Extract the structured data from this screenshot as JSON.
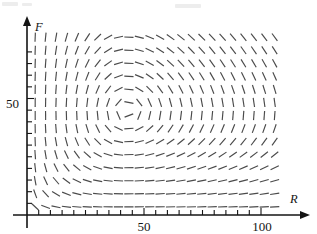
{
  "figure": {
    "kind": "direction-field",
    "background_color": "#ffffff",
    "mark_color": "#4a4a4a",
    "axis_color": "#141414"
  },
  "axes": {
    "x": {
      "label": "R",
      "label_style": "italic-serif",
      "tick_labels": [
        "50",
        "100"
      ],
      "tick_label_values": [
        50,
        100
      ],
      "minor_ticks_count": 20,
      "range": [
        0,
        108
      ],
      "arrow": true
    },
    "y": {
      "label": "F",
      "label_style": "italic-serif",
      "tick_labels": [
        "50"
      ],
      "tick_label_values": [
        50
      ],
      "minor_ticks_count": 14,
      "range": [
        0,
        85
      ],
      "arrow": true
    }
  },
  "chart_data": {
    "type": "scatter",
    "subtype": "direction_field",
    "title": "",
    "xlabel": "R",
    "ylabel": "F",
    "xlim": [
      0,
      108
    ],
    "ylim": [
      0,
      85
    ],
    "grid": false,
    "legend": "none",
    "equilibrium": {
      "R": 43,
      "F": 45
    },
    "model": {
      "dR_dt": "a*R - b*R*F",
      "dF_dt": "-c*F + d*R*F",
      "a": 0.08,
      "b": 0.0018,
      "c": 0.075,
      "d": 0.00175
    },
    "grid_columns": 24,
    "grid_rows": 14,
    "x_sample_start": 3.5,
    "x_sample_step": 4.45,
    "y_sample_start": 3.5,
    "y_sample_step": 5.6,
    "mark_length_px": 9.2
  },
  "geometry": {
    "origin_px": {
      "x": 27,
      "y": 215
    },
    "x_scale_px_per_unit": 2.34,
    "y_scale_px_per_unit": 2.33,
    "x_tick_step_units": 5,
    "y_tick_step_units": 5,
    "plot_right_px": 305,
    "plot_top_px": 18
  }
}
